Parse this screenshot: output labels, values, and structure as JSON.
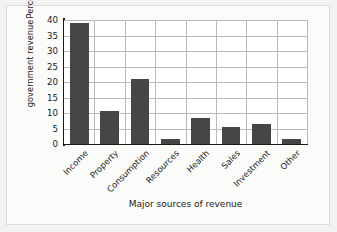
{
  "chart_data": {
    "type": "bar",
    "title": "",
    "xlabel": "Major sources of revenue",
    "ylabel_lines": [
      "Percentage of",
      "government revenue"
    ],
    "ylabel": "Percentage of government revenue",
    "categories": [
      "Income",
      "Property",
      "Consumption",
      "Resources",
      "Health",
      "Sales",
      "Investment",
      "Other"
    ],
    "values": [
      39,
      10.5,
      21,
      1.5,
      8.5,
      5.5,
      6.5,
      1.5
    ],
    "ylim": [
      0,
      40
    ],
    "yticks": [
      0,
      5,
      10,
      15,
      20,
      25,
      30,
      35,
      40
    ],
    "grid": true,
    "legend": "none",
    "bar_color": "#464646",
    "grid_color": "#b9b9b7",
    "axis_color": "#1a1a1a",
    "plot_background": "#ffffff",
    "figure_background": "#f2f2f0"
  }
}
